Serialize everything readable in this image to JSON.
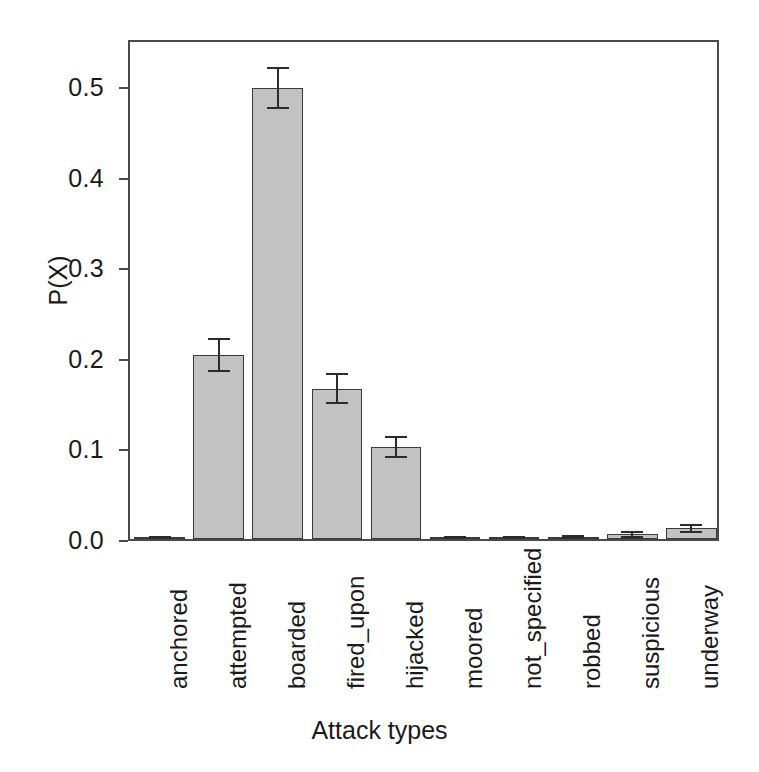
{
  "chart_data": {
    "type": "bar",
    "title": "",
    "xlabel": "Attack types",
    "ylabel": "P(X)",
    "categories": [
      "anchored",
      "attempted",
      "boarded",
      "fired_upon",
      "hijacked",
      "moored",
      "not_specified",
      "robbed",
      "suspicious",
      "underway"
    ],
    "values": [
      0.001,
      0.203,
      0.498,
      0.166,
      0.102,
      0.001,
      0.001,
      0.002,
      0.005,
      0.012
    ],
    "errors": [
      0.001,
      0.018,
      0.022,
      0.016,
      0.011,
      0.001,
      0.001,
      0.001,
      0.003,
      0.004
    ],
    "ylim": [
      0.0,
      0.553
    ],
    "xlim": [
      0,
      10
    ],
    "yticks": [
      0.0,
      0.1,
      0.2,
      0.3,
      0.4,
      0.5
    ],
    "ytick_labels": [
      "0.0",
      "0.1",
      "0.2",
      "0.3",
      "0.4",
      "0.5"
    ],
    "grid": false,
    "legend": false,
    "legend_position": "none",
    "bar_color": "#c2c2c2",
    "bar_edge_color": "#3a3a3a",
    "error_bar_color": "#2b2b2b",
    "axis_color": "#4a4a4a",
    "background_color": "#ffffff",
    "error_bar_style": "capped-T",
    "xtick_rotation": 90
  }
}
